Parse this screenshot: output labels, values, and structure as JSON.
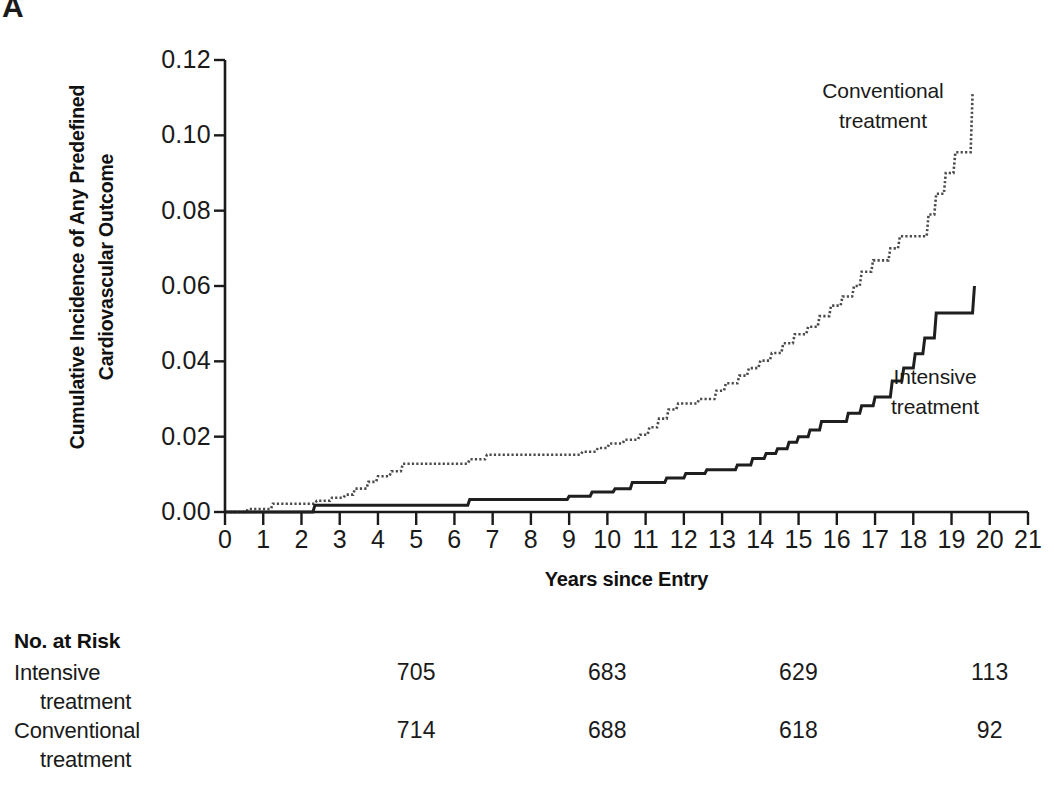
{
  "panel": {
    "letter": "A"
  },
  "axes": {
    "y_title_line1": "Cumulative Incidence of Any Predefined",
    "y_title_line2": "Cardiovascular Outcome",
    "x_title": "Years since Entry",
    "y_ticks": [
      "0.00",
      "0.02",
      "0.04",
      "0.06",
      "0.08",
      "0.10",
      "0.12"
    ],
    "x_ticks": [
      "0",
      "1",
      "2",
      "3",
      "4",
      "5",
      "6",
      "7",
      "8",
      "9",
      "10",
      "11",
      "12",
      "13",
      "14",
      "15",
      "16",
      "17",
      "18",
      "19",
      "20",
      "21"
    ]
  },
  "annotations": {
    "conventional_line1": "Conventional",
    "conventional_line2": "treatment",
    "intensive_line1": "Intensive",
    "intensive_line2": "treatment"
  },
  "risk_table": {
    "title": "No. at Risk",
    "rows": [
      {
        "label_line1": "Intensive",
        "label_line2": "treatment",
        "values": [
          "705",
          "683",
          "629",
          "113"
        ]
      },
      {
        "label_line1": "Conventional",
        "label_line2": "treatment",
        "values": [
          "714",
          "688",
          "618",
          "92"
        ]
      }
    ],
    "value_years": [
      5,
      10,
      15,
      20
    ]
  },
  "chart_data": {
    "type": "line",
    "subtype": "kaplan-meier-cumulative-incidence",
    "title": "",
    "xlabel": "Years since Entry",
    "ylabel": "Cumulative Incidence of Any Predefined Cardiovascular Outcome",
    "xlim": [
      0,
      21
    ],
    "ylim": [
      0.0,
      0.12
    ],
    "xticks": [
      0,
      1,
      2,
      3,
      4,
      5,
      6,
      7,
      8,
      9,
      10,
      11,
      12,
      13,
      14,
      15,
      16,
      17,
      18,
      19,
      20,
      21
    ],
    "yticks": [
      0.0,
      0.02,
      0.04,
      0.06,
      0.08,
      0.1,
      0.12
    ],
    "grid": false,
    "legend": "inline-annotations",
    "series": [
      {
        "name": "Conventional treatment",
        "style": "dotted",
        "color": "#4a4a4a",
        "points": [
          [
            0.0,
            0.0
          ],
          [
            0.55,
            0.0
          ],
          [
            0.6,
            0.0008
          ],
          [
            1.2,
            0.0008
          ],
          [
            1.25,
            0.0022
          ],
          [
            2.35,
            0.0022
          ],
          [
            2.4,
            0.003
          ],
          [
            2.75,
            0.003
          ],
          [
            2.8,
            0.0038
          ],
          [
            3.1,
            0.0038
          ],
          [
            3.15,
            0.0046
          ],
          [
            3.35,
            0.0046
          ],
          [
            3.4,
            0.0062
          ],
          [
            3.7,
            0.0062
          ],
          [
            3.75,
            0.008
          ],
          [
            3.95,
            0.008
          ],
          [
            4.0,
            0.0095
          ],
          [
            4.3,
            0.0095
          ],
          [
            4.35,
            0.0108
          ],
          [
            4.6,
            0.0108
          ],
          [
            4.65,
            0.0128
          ],
          [
            6.35,
            0.0128
          ],
          [
            6.4,
            0.014
          ],
          [
            6.8,
            0.014
          ],
          [
            6.85,
            0.0152
          ],
          [
            9.3,
            0.0152
          ],
          [
            9.35,
            0.016
          ],
          [
            9.7,
            0.016
          ],
          [
            9.75,
            0.017
          ],
          [
            10.0,
            0.017
          ],
          [
            10.05,
            0.0182
          ],
          [
            10.4,
            0.0182
          ],
          [
            10.45,
            0.0192
          ],
          [
            10.8,
            0.0192
          ],
          [
            10.85,
            0.0205
          ],
          [
            11.05,
            0.0205
          ],
          [
            11.1,
            0.0225
          ],
          [
            11.3,
            0.0225
          ],
          [
            11.35,
            0.0248
          ],
          [
            11.55,
            0.0248
          ],
          [
            11.6,
            0.0272
          ],
          [
            11.8,
            0.0272
          ],
          [
            11.85,
            0.0288
          ],
          [
            12.35,
            0.0288
          ],
          [
            12.4,
            0.03
          ],
          [
            12.8,
            0.03
          ],
          [
            12.85,
            0.0322
          ],
          [
            13.05,
            0.0322
          ],
          [
            13.1,
            0.0342
          ],
          [
            13.4,
            0.0342
          ],
          [
            13.45,
            0.0362
          ],
          [
            13.65,
            0.0362
          ],
          [
            13.7,
            0.0382
          ],
          [
            13.95,
            0.0382
          ],
          [
            14.0,
            0.0402
          ],
          [
            14.25,
            0.0402
          ],
          [
            14.3,
            0.0422
          ],
          [
            14.55,
            0.0422
          ],
          [
            14.6,
            0.0448
          ],
          [
            14.85,
            0.0448
          ],
          [
            14.9,
            0.0472
          ],
          [
            15.2,
            0.0472
          ],
          [
            15.25,
            0.0492
          ],
          [
            15.5,
            0.0492
          ],
          [
            15.55,
            0.052
          ],
          [
            15.8,
            0.052
          ],
          [
            15.85,
            0.0548
          ],
          [
            16.1,
            0.0548
          ],
          [
            16.15,
            0.0572
          ],
          [
            16.4,
            0.0572
          ],
          [
            16.45,
            0.06
          ],
          [
            16.6,
            0.06
          ],
          [
            16.65,
            0.0638
          ],
          [
            16.9,
            0.0638
          ],
          [
            16.95,
            0.0668
          ],
          [
            17.35,
            0.0668
          ],
          [
            17.4,
            0.07
          ],
          [
            17.6,
            0.07
          ],
          [
            17.65,
            0.0732
          ],
          [
            18.35,
            0.0732
          ],
          [
            18.4,
            0.079
          ],
          [
            18.55,
            0.079
          ],
          [
            18.6,
            0.0845
          ],
          [
            18.8,
            0.0845
          ],
          [
            18.85,
            0.09
          ],
          [
            19.05,
            0.09
          ],
          [
            19.1,
            0.0955
          ],
          [
            19.5,
            0.0955
          ],
          [
            19.55,
            0.111
          ],
          [
            19.55,
            0.111
          ]
        ]
      },
      {
        "name": "Intensive treatment",
        "style": "solid",
        "color": "#1f1f1f",
        "points": [
          [
            0.0,
            0.0
          ],
          [
            2.3,
            0.0
          ],
          [
            2.35,
            0.0018
          ],
          [
            6.35,
            0.0018
          ],
          [
            6.4,
            0.0033
          ],
          [
            8.95,
            0.0033
          ],
          [
            9.0,
            0.0042
          ],
          [
            9.55,
            0.0042
          ],
          [
            9.6,
            0.0053
          ],
          [
            10.15,
            0.0053
          ],
          [
            10.2,
            0.0062
          ],
          [
            10.6,
            0.0062
          ],
          [
            10.65,
            0.0078
          ],
          [
            11.5,
            0.0078
          ],
          [
            11.55,
            0.009
          ],
          [
            12.0,
            0.009
          ],
          [
            12.05,
            0.0102
          ],
          [
            12.55,
            0.0102
          ],
          [
            12.6,
            0.0112
          ],
          [
            13.35,
            0.0112
          ],
          [
            13.4,
            0.0125
          ],
          [
            13.75,
            0.0125
          ],
          [
            13.8,
            0.0142
          ],
          [
            14.1,
            0.0142
          ],
          [
            14.15,
            0.0155
          ],
          [
            14.4,
            0.0155
          ],
          [
            14.45,
            0.0168
          ],
          [
            14.7,
            0.0168
          ],
          [
            14.75,
            0.0185
          ],
          [
            14.95,
            0.0185
          ],
          [
            15.0,
            0.02
          ],
          [
            15.25,
            0.02
          ],
          [
            15.3,
            0.0218
          ],
          [
            15.55,
            0.0218
          ],
          [
            15.6,
            0.024
          ],
          [
            16.25,
            0.024
          ],
          [
            16.3,
            0.0262
          ],
          [
            16.6,
            0.0262
          ],
          [
            16.65,
            0.0282
          ],
          [
            16.95,
            0.0282
          ],
          [
            17.0,
            0.0305
          ],
          [
            17.4,
            0.0305
          ],
          [
            17.45,
            0.0348
          ],
          [
            17.7,
            0.0348
          ],
          [
            17.75,
            0.0382
          ],
          [
            18.0,
            0.0382
          ],
          [
            18.05,
            0.042
          ],
          [
            18.25,
            0.042
          ],
          [
            18.3,
            0.0462
          ],
          [
            18.55,
            0.0462
          ],
          [
            18.6,
            0.0528
          ],
          [
            19.55,
            0.0528
          ],
          [
            19.6,
            0.06
          ],
          [
            19.6,
            0.06
          ]
        ]
      }
    ]
  }
}
